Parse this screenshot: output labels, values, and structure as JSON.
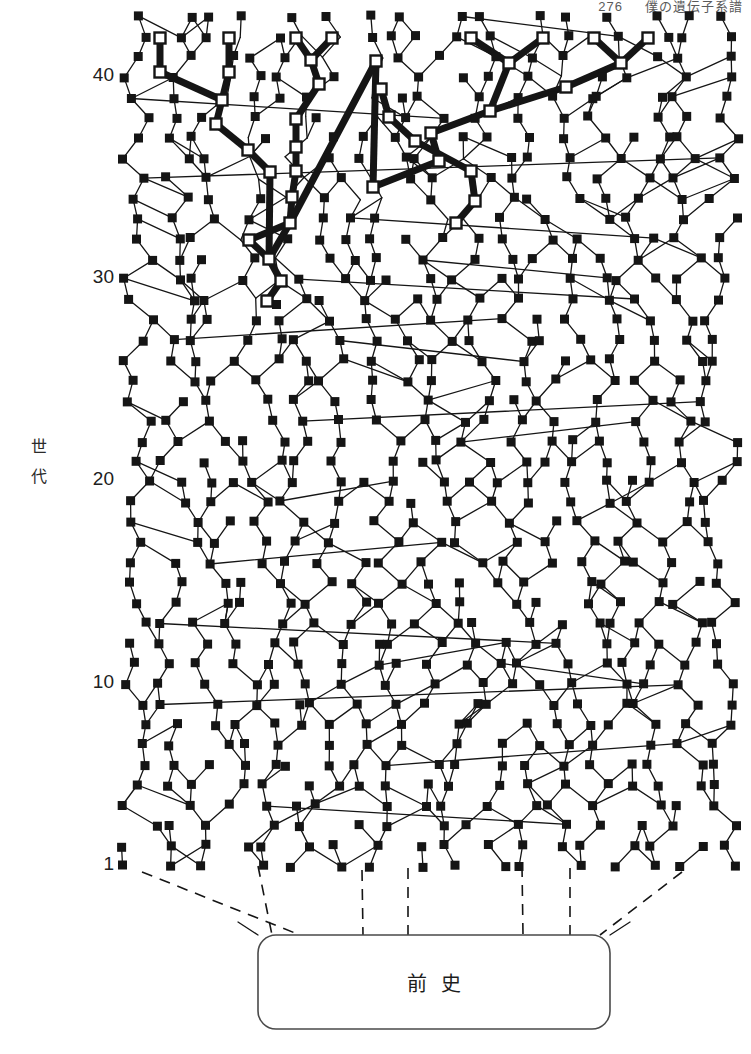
{
  "header": {
    "page_number": "276",
    "running_title": "僕の遺伝子系譜"
  },
  "axis": {
    "title": "世代",
    "title_chars": [
      "世",
      "代"
    ],
    "ticks": [
      {
        "label": "40",
        "y": 77
      },
      {
        "label": "30",
        "y": 279
      },
      {
        "label": "20",
        "y": 481
      },
      {
        "label": "10",
        "y": 684
      },
      {
        "label": "1",
        "y": 866
      }
    ]
  },
  "prehistory_box": {
    "label": "前史",
    "x": 258,
    "y": 935,
    "width": 352,
    "height": 94,
    "corner_radius": 18
  },
  "legend_semantics": {
    "normal_node": "filled black square = ordinary ancestor",
    "highlight_node": "hollow white square = traced lineage ancestor",
    "normal_link": "thin line = ordinary descent link",
    "highlight_link": "thick line = traced lineage descent link",
    "dashed_link": "dashed line = link into prehistory"
  },
  "colors": {
    "ink": "#151515",
    "paper": "#ffffff",
    "node_fill": "#151515",
    "node_hollow_fill": "#ffffff",
    "box_stroke": "#4a4a4a",
    "header_text": "#5a5a5a"
  },
  "chart_data": {
    "type": "diagram",
    "title": "僕の遺伝子系譜",
    "ylabel": "世代",
    "ylim": [
      1,
      43
    ],
    "y_ticks": [
      1,
      10,
      20,
      30,
      40
    ],
    "x_range": [
      120,
      740
    ],
    "generation_count": 43,
    "gen1_y": 866,
    "gen_spacing_px": 20.23,
    "node_size": 9,
    "hollow_node_size": 11,
    "thin_line_width": 1.3,
    "thick_line_width": 7,
    "nodes": [
      {
        "id": "h1",
        "x": 160,
        "y": 38,
        "t": "h"
      },
      {
        "id": "h2",
        "x": 160,
        "y": 72,
        "t": "h"
      },
      {
        "id": "h3",
        "x": 229,
        "y": 38,
        "t": "h"
      },
      {
        "id": "h4",
        "x": 229,
        "y": 72,
        "t": "h"
      },
      {
        "id": "h5",
        "x": 222,
        "y": 98,
        "t": "h"
      },
      {
        "id": "h6",
        "x": 214,
        "y": 122,
        "t": "h"
      },
      {
        "id": "h7",
        "x": 246,
        "y": 148,
        "t": "h"
      },
      {
        "id": "h8",
        "x": 268,
        "y": 170,
        "t": "h"
      },
      {
        "id": "h9",
        "x": 296,
        "y": 38,
        "t": "h"
      },
      {
        "id": "h10",
        "x": 332,
        "y": 38,
        "t": "h"
      },
      {
        "id": "h11",
        "x": 310,
        "y": 60,
        "t": "h"
      },
      {
        "id": "h12",
        "x": 318,
        "y": 84,
        "t": "h"
      },
      {
        "id": "h13",
        "x": 333,
        "y": 110,
        "t": "h"
      },
      {
        "id": "h14",
        "x": 296,
        "y": 118,
        "t": "h"
      },
      {
        "id": "h15",
        "x": 296,
        "y": 146,
        "t": "h"
      },
      {
        "id": "h16",
        "x": 296,
        "y": 170,
        "t": "h"
      },
      {
        "id": "h17",
        "x": 292,
        "y": 196,
        "t": "h"
      },
      {
        "id": "h18",
        "x": 290,
        "y": 222,
        "t": "h"
      },
      {
        "id": "h19",
        "x": 246,
        "y": 238,
        "t": "h"
      },
      {
        "id": "h20",
        "x": 268,
        "y": 258,
        "t": "h"
      },
      {
        "id": "h21",
        "x": 280,
        "y": 280,
        "t": "h"
      },
      {
        "id": "h22",
        "x": 266,
        "y": 300,
        "t": "h"
      },
      {
        "id": "h23",
        "x": 471,
        "y": 38,
        "t": "h"
      },
      {
        "id": "h24",
        "x": 543,
        "y": 38,
        "t": "h"
      },
      {
        "id": "h25",
        "x": 509,
        "y": 62,
        "t": "h"
      },
      {
        "id": "h26",
        "x": 594,
        "y": 38,
        "t": "h"
      },
      {
        "id": "h27",
        "x": 648,
        "y": 38,
        "t": "h"
      },
      {
        "id": "h28",
        "x": 620,
        "y": 62,
        "t": "h"
      },
      {
        "id": "h29",
        "x": 565,
        "y": 86,
        "t": "h"
      },
      {
        "id": "h30",
        "x": 489,
        "y": 110,
        "t": "h"
      },
      {
        "id": "h31",
        "x": 430,
        "y": 132,
        "t": "h"
      },
      {
        "id": "h32",
        "x": 438,
        "y": 160,
        "t": "h"
      },
      {
        "id": "h33",
        "x": 372,
        "y": 186,
        "t": "h"
      },
      {
        "id": "h34",
        "x": 376,
        "y": 60,
        "t": "h"
      },
      {
        "id": "h35",
        "x": 380,
        "y": 88,
        "t": "h"
      },
      {
        "id": "h36",
        "x": 388,
        "y": 116,
        "t": "h"
      },
      {
        "id": "h37",
        "x": 414,
        "y": 140,
        "t": "h"
      },
      {
        "id": "h38",
        "x": 470,
        "y": 170,
        "t": "h"
      },
      {
        "id": "h39",
        "x": 474,
        "y": 200,
        "t": "h"
      },
      {
        "id": "h40",
        "x": 455,
        "y": 222,
        "t": "h"
      }
    ],
    "highlight_path": [
      [
        160,
        38
      ],
      [
        160,
        72
      ],
      [
        229,
        38
      ],
      [
        229,
        72
      ],
      [
        296,
        38
      ],
      [
        332,
        38
      ]
    ]
  }
}
